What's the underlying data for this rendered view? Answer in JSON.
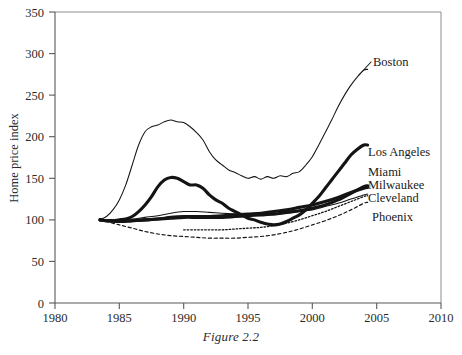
{
  "caption": "Figure 2.2",
  "axes": {
    "y_title": "Home price index",
    "y_ticks": [
      "0",
      "50",
      "100",
      "150",
      "200",
      "250",
      "300",
      "350"
    ],
    "x_ticks": [
      "1980",
      "1985",
      "1990",
      "1995",
      "2000",
      "2005",
      "2010"
    ]
  },
  "labels": {
    "boston": "Boston",
    "los_angeles": "Los Angeles",
    "miami": "Miami",
    "milwaukee": "Milwaukee",
    "cleveland": "Cleveland",
    "phoenix": "Phoenix"
  },
  "chart_data": {
    "type": "line",
    "title": "Figure 2.2",
    "xlabel": "",
    "ylabel": "Home price index",
    "xlim": [
      1980,
      2010
    ],
    "ylim": [
      0,
      350
    ],
    "ytick_interval": 50,
    "xtick_interval": 5,
    "grid": false,
    "legend": "inline-right-labels",
    "colors": {
      "all_series": "#141414",
      "axis": "#59595b",
      "frame": "#8d8d90"
    },
    "series": [
      {
        "name": "Boston",
        "style": "thin-solid",
        "x": [
          1983.5,
          1984,
          1984.5,
          1985,
          1985.5,
          1986,
          1986.5,
          1987,
          1987.5,
          1988,
          1988.5,
          1989,
          1989.5,
          1990,
          1990.5,
          1991,
          1991.5,
          1992,
          1992.5,
          1993,
          1993.5,
          1994,
          1994.5,
          1995,
          1995.5,
          1996,
          1996.5,
          1997,
          1997.5,
          1998,
          1998.5,
          1999,
          1999.5,
          2000,
          2000.5,
          2001,
          2001.5,
          2002,
          2002.5,
          2003,
          2003.5,
          2004,
          2004.3
        ],
        "values": [
          100,
          104,
          112,
          124,
          142,
          166,
          190,
          206,
          212,
          214,
          218,
          220,
          218,
          217,
          212,
          205,
          196,
          182,
          172,
          166,
          160,
          157,
          153,
          150,
          152,
          149,
          152,
          150,
          153,
          152,
          156,
          158,
          166,
          176,
          190,
          205,
          220,
          236,
          250,
          262,
          272,
          280,
          281
        ]
      },
      {
        "name": "Los Angeles",
        "style": "thick-solid",
        "x": [
          1983.5,
          1984,
          1984.5,
          1985,
          1985.5,
          1986,
          1986.5,
          1987,
          1987.5,
          1988,
          1988.5,
          1989,
          1989.5,
          1990,
          1990.5,
          1991,
          1991.5,
          1992,
          1992.5,
          1993,
          1993.5,
          1994,
          1994.5,
          1995,
          1995.5,
          1996,
          1996.5,
          1997,
          1997.5,
          1998,
          1998.5,
          1999,
          1999.5,
          2000,
          2000.5,
          2001,
          2001.5,
          2002,
          2002.5,
          2003,
          2003.5,
          2004,
          2004.3
        ],
        "values": [
          100,
          99,
          99,
          100,
          101,
          104,
          110,
          118,
          128,
          140,
          148,
          151,
          150,
          146,
          142,
          142,
          138,
          130,
          124,
          120,
          114,
          110,
          106,
          102,
          100,
          97,
          95,
          94,
          95,
          98,
          102,
          106,
          112,
          120,
          128,
          138,
          148,
          158,
          168,
          178,
          185,
          190,
          190
        ]
      },
      {
        "name": "Miami",
        "style": "thick-solid-lower",
        "x": [
          1983.5,
          1984,
          1985,
          1986,
          1987,
          1988,
          1989,
          1990,
          1991,
          1992,
          1993,
          1994,
          1995,
          1996,
          1997,
          1998,
          1999,
          2000,
          2001,
          2002,
          2003,
          2004,
          2004.3
        ],
        "values": [
          100,
          99,
          98,
          99,
          100,
          101,
          102,
          103,
          103,
          103,
          103,
          104,
          105,
          106,
          107,
          109,
          111,
          114,
          118,
          124,
          132,
          140,
          141
        ]
      },
      {
        "name": "Milwaukee",
        "style": "thick-solid-lower",
        "x": [
          1983.5,
          1984,
          1985,
          1986,
          1987,
          1988,
          1989,
          1990,
          1991,
          1992,
          1993,
          1994,
          1995,
          1996,
          1997,
          1998,
          1999,
          2000,
          2001,
          2002,
          2003,
          2004,
          2004.3
        ],
        "values": [
          100,
          99,
          98,
          99,
          100,
          101,
          103,
          104,
          104,
          104,
          105,
          106,
          107,
          108,
          110,
          112,
          115,
          118,
          122,
          127,
          133,
          138,
          139
        ]
      },
      {
        "name": "Cleveland",
        "style": "thin-solid",
        "x": [
          1983.5,
          1984,
          1985,
          1986,
          1987,
          1988,
          1989,
          1990,
          1991,
          1992,
          1993,
          1994,
          1995,
          1996,
          1997,
          1998,
          1999,
          2000,
          2001,
          2002,
          2003,
          2004,
          2004.3
        ],
        "values": [
          100,
          100,
          100,
          101,
          103,
          105,
          108,
          110,
          110,
          109,
          108,
          107,
          106,
          106,
          106,
          108,
          110,
          112,
          116,
          120,
          125,
          130,
          131
        ]
      },
      {
        "name": "Phoenix",
        "style": "dashed",
        "x": [
          1983.5,
          1984,
          1985,
          1986,
          1987,
          1988,
          1989,
          1990,
          1991,
          1992,
          1993,
          1994,
          1995,
          1996,
          1997,
          1998,
          1999,
          2000,
          2001,
          2002,
          2003,
          2004,
          2004.3
        ],
        "values": [
          100,
          98,
          94,
          90,
          86,
          83,
          81,
          80,
          79,
          78,
          78,
          78,
          79,
          80,
          82,
          85,
          89,
          94,
          99,
          105,
          112,
          120,
          121
        ]
      },
      {
        "name": "Phoenix-dotted-upper",
        "style": "dotted",
        "x": [
          1990,
          1991,
          1992,
          1993,
          1994,
          1995,
          1996,
          1997,
          1998,
          1999,
          2000,
          2001,
          2002,
          2003,
          2004,
          2004.3
        ],
        "values": [
          88,
          88,
          88,
          88,
          89,
          90,
          91,
          93,
          96,
          100,
          105,
          110,
          116,
          122,
          128,
          129
        ]
      }
    ]
  }
}
